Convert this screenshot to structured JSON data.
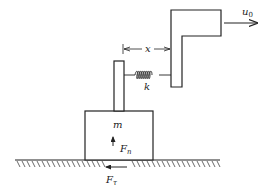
{
  "diagram": {
    "title": "",
    "labels": {
      "displacement": "x",
      "spring_constant": "k",
      "mass": "m",
      "velocity": "u",
      "velocity_sub": "0",
      "normal_force": "F",
      "normal_force_sub": "n",
      "friction_force": "F",
      "friction_force_sub": "τ"
    },
    "components": [
      {
        "id": "mass-block",
        "label": "m"
      },
      {
        "id": "post",
        "label": ""
      },
      {
        "id": "spring",
        "label": "k"
      },
      {
        "id": "driver-bracket",
        "label": ""
      },
      {
        "id": "ground",
        "label": ""
      }
    ],
    "arrows": [
      {
        "id": "velocity-arrow",
        "direction": "right",
        "label": "u0"
      },
      {
        "id": "normal-force-arrow",
        "direction": "up",
        "label": "Fn"
      },
      {
        "id": "friction-force-arrow",
        "direction": "left",
        "label": "Fτ"
      },
      {
        "id": "displacement-dimension",
        "direction": "both",
        "label": "x"
      }
    ],
    "colors": {
      "stroke": "#222222",
      "background": "#ffffff"
    }
  }
}
